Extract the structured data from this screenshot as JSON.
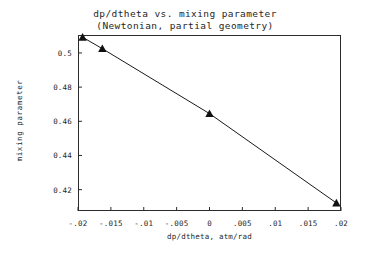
{
  "chart_data": {
    "type": "line",
    "title": "dp/dtheta vs. mixing parameter",
    "subtitle": "(Newtonian, partial geometry)",
    "xlabel": "dp/dtheta, atm/rad",
    "ylabel": "mixing parameter",
    "xlim": [
      -0.02,
      0.02
    ],
    "ylim": [
      0.4075,
      0.5105
    ],
    "grid": false,
    "legend": "none",
    "marker": "triangle",
    "line_color": "#1a1a1a",
    "marker_color": "#111111",
    "background_color": "#ffffff",
    "frame_color": "#2b2b2b",
    "x": [
      -0.0193,
      -0.0163,
      0.0,
      0.0193
    ],
    "y": [
      0.5092,
      0.5025,
      0.4645,
      0.4122
    ],
    "series": [
      {
        "name": "mixing parameter",
        "points": [
          {
            "x": -0.0193,
            "y": 0.5092
          },
          {
            "x": -0.0163,
            "y": 0.5025
          },
          {
            "x": 0.0,
            "y": 0.4645
          },
          {
            "x": 0.0193,
            "y": 0.4122
          }
        ]
      }
    ],
    "xticks": [
      {
        "value": -0.02,
        "label": "-.02"
      },
      {
        "value": -0.015,
        "label": "-.015"
      },
      {
        "value": -0.01,
        "label": "-.01"
      },
      {
        "value": -0.005,
        "label": "-.005"
      },
      {
        "value": 0,
        "label": "0"
      },
      {
        "value": 0.005,
        "label": ".005"
      },
      {
        "value": 0.01,
        "label": ".01"
      },
      {
        "value": 0.015,
        "label": ".015"
      },
      {
        "value": 0.02,
        "label": ".02"
      }
    ],
    "yticks": [
      {
        "value": 0.5,
        "label": "0.5"
      },
      {
        "value": 0.48,
        "label": "0.48"
      },
      {
        "value": 0.46,
        "label": "0.46"
      },
      {
        "value": 0.44,
        "label": "0.44"
      },
      {
        "value": 0.42,
        "label": "0.42"
      }
    ]
  }
}
